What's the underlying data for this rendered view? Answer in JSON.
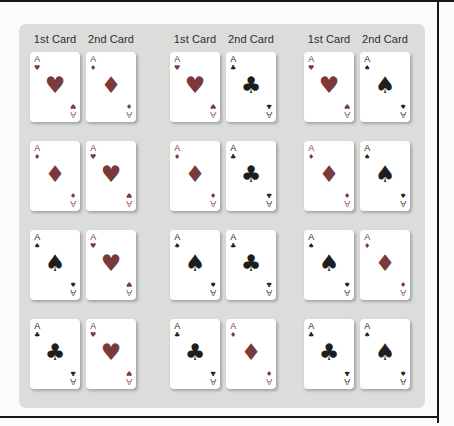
{
  "figure": {
    "header_first": "1st Card",
    "header_second": "2nd Card"
  },
  "rank": "A",
  "colors": {
    "red_suit": "#7a3a3c",
    "black_suit": "#1e1e1e",
    "panel_bg": "#dcdcdb",
    "page_bg": "#fbfbf9",
    "frame": "#161616"
  },
  "suits": {
    "heart": {
      "glyph": "♥",
      "color": "red_suit",
      "name": "hearts"
    },
    "diamond": {
      "glyph": "♦",
      "color": "red_suit",
      "name": "diamonds"
    },
    "club": {
      "glyph": "♣",
      "color": "black_suit",
      "name": "clubs"
    },
    "spade": {
      "glyph": "♠",
      "color": "black_suit",
      "name": "spades"
    }
  },
  "groups": [
    {
      "pairs": [
        [
          "heart",
          "diamond"
        ],
        [
          "diamond",
          "heart"
        ],
        [
          "spade",
          "heart"
        ],
        [
          "club",
          "heart"
        ]
      ]
    },
    {
      "pairs": [
        [
          "heart",
          "club"
        ],
        [
          "diamond",
          "club"
        ],
        [
          "spade",
          "club"
        ],
        [
          "club",
          "diamond"
        ]
      ]
    },
    {
      "pairs": [
        [
          "heart",
          "spade"
        ],
        [
          "diamond",
          "spade"
        ],
        [
          "spade",
          "diamond"
        ],
        [
          "club",
          "spade"
        ]
      ]
    }
  ]
}
